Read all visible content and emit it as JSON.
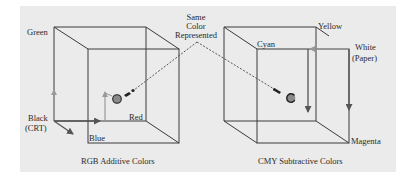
{
  "figure": {
    "background_color": "#ebebeb",
    "center_label": [
      "Same",
      "Color",
      "Represented"
    ],
    "rgb_cube": {
      "caption": "RGB Additive Colors",
      "corners": {
        "green": "Green",
        "black": [
          "Black",
          "(CRT)"
        ],
        "red": "Red",
        "blue": "Blue"
      },
      "arrow_color": "#9a9a9a"
    },
    "cmy_cube": {
      "caption": "CMY Subtractive Colors",
      "corners": {
        "yellow": "Yellow",
        "cyan": "Cyan",
        "white": [
          "White",
          "(Paper)"
        ],
        "magenta": "Magenta"
      },
      "arrow_color": "#9a9a9a"
    },
    "point_color": "#8a8a8a"
  }
}
